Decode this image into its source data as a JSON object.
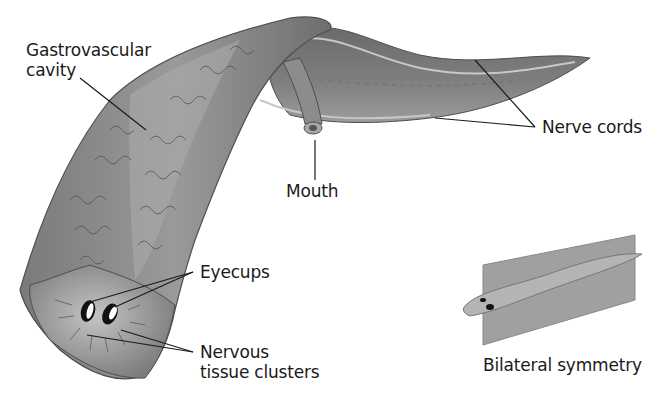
{
  "diagram": {
    "labels": {
      "gastrovascular_cavity": "Gastrovascular\ncavity",
      "mouth": "Mouth",
      "nerve_cords": "Nerve cords",
      "eyecups": "Eyecups",
      "nervous_tissue_clusters": "Nervous\ntissue clusters",
      "bilateral_symmetry": "Bilateral symmetry"
    },
    "colors": {
      "background": "#ffffff",
      "body_fill": "#8a8a8a",
      "body_dark": "#5a5a5a",
      "body_light": "#b8b8b8",
      "leader_line": "#1a1a1a",
      "plane": "#a0a0a0"
    }
  }
}
